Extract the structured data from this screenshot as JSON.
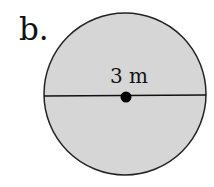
{
  "problem_label": "b.",
  "figure": {
    "shape": "circle",
    "measurement_label": "3 m",
    "measured_segment": "diameter",
    "fill_color": "#d6d6d6",
    "stroke_color": "#222222"
  }
}
